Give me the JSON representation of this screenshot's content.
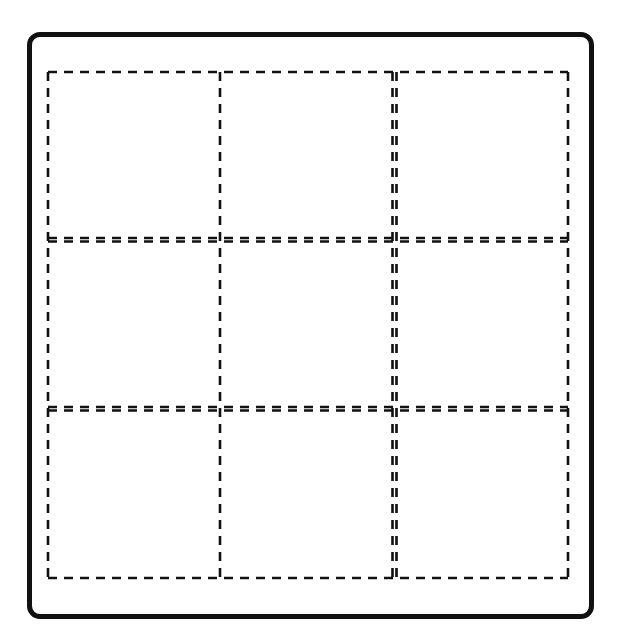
{
  "diagram": {
    "type": "dashed-grid-template",
    "rows": 3,
    "columns": 3,
    "cells": [
      {
        "row": 1,
        "col": 1,
        "content": ""
      },
      {
        "row": 1,
        "col": 2,
        "content": ""
      },
      {
        "row": 1,
        "col": 3,
        "content": ""
      },
      {
        "row": 2,
        "col": 1,
        "content": ""
      },
      {
        "row": 2,
        "col": 2,
        "content": ""
      },
      {
        "row": 2,
        "col": 3,
        "content": ""
      },
      {
        "row": 3,
        "col": 1,
        "content": ""
      },
      {
        "row": 3,
        "col": 2,
        "content": ""
      },
      {
        "row": 3,
        "col": 3,
        "content": ""
      }
    ],
    "colors": {
      "frame": "#111111",
      "dash": "#111111",
      "background": "#ffffff"
    }
  }
}
